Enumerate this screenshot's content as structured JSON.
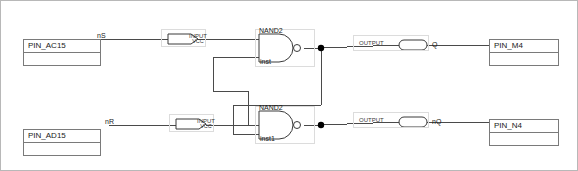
{
  "diagram": {
    "type": "logic-schematic",
    "colors": {
      "background": "#ffffff",
      "grid_dot": "#c9c9c9",
      "wire": "#4a4a4a",
      "symbol_outline": "#3a3a3a",
      "box_outline": "#7a7a7a",
      "frame_outline": "#dcdcdc",
      "text": "#1a1a1a",
      "junction": "#000000"
    }
  },
  "pin_boxes": [
    {
      "name": "pin-box-ac15",
      "label": "PIN_AC15",
      "x": 22,
      "y": 38,
      "w": 78,
      "h": 27
    },
    {
      "name": "pin-box-ad15",
      "label": "PIN_AD15",
      "x": 22,
      "y": 128,
      "w": 78,
      "h": 27
    },
    {
      "name": "pin-box-m4",
      "label": "PIN_M4",
      "x": 488,
      "y": 38,
      "w": 70,
      "h": 27
    },
    {
      "name": "pin-box-n4",
      "label": "PIN_N4",
      "x": 488,
      "y": 118,
      "w": 70,
      "h": 27
    }
  ],
  "net_labels": [
    {
      "name": "net-label-ns",
      "text": "nS",
      "x": 96,
      "y": 35
    },
    {
      "name": "net-label-nr",
      "text": "nR",
      "x": 104,
      "y": 120
    },
    {
      "name": "net-label-q",
      "text": "Q",
      "x": 427,
      "y": 42
    },
    {
      "name": "net-label-nq",
      "text": "nQ",
      "x": 427,
      "y": 119
    }
  ],
  "input_ports": [
    {
      "name": "input-port-ns",
      "type": "INPUT",
      "default": "VCC",
      "x": 167,
      "y": 33,
      "w": 30,
      "h": 10
    },
    {
      "name": "input-port-nr",
      "type": "INPUT",
      "default": "VCC",
      "x": 175,
      "y": 118,
      "w": 30,
      "h": 10
    }
  ],
  "output_ports": [
    {
      "name": "output-port-q",
      "type": "OUTPUT",
      "x": 398,
      "y": 39,
      "w": 28,
      "h": 10
    },
    {
      "name": "output-port-nq",
      "type": "OUTPUT",
      "x": 398,
      "y": 116,
      "w": 28,
      "h": 10
    }
  ],
  "gates": [
    {
      "name": "nand-gate-upper",
      "type": "NAND2",
      "instance": "inst",
      "x": 258,
      "y": 33,
      "w": 40,
      "h": 28
    },
    {
      "name": "nand-gate-lower",
      "type": "NAND2",
      "instance": "inst1",
      "x": 258,
      "y": 110,
      "w": 40,
      "h": 28
    }
  ],
  "junctions": [
    {
      "name": "junction-q",
      "x": 320,
      "y": 47
    },
    {
      "name": "junction-nq",
      "x": 320,
      "y": 124
    }
  ]
}
